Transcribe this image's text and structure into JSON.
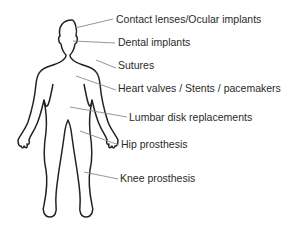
{
  "diagram": {
    "type": "labeled-body-outline",
    "colors": {
      "outline": "#222222",
      "leader": "#8a8a8a",
      "text": "#2a2a2a"
    },
    "labels": [
      {
        "text": "Contact lenses/Ocular implants",
        "x": 116,
        "y": 13,
        "points_to": "eye"
      },
      {
        "text": "Dental implants",
        "x": 118,
        "y": 36,
        "points_to": "mouth"
      },
      {
        "text": "Sutures",
        "x": 118,
        "y": 59,
        "points_to": "shoulder"
      },
      {
        "text": "Heart valves / Stents / pacemakers",
        "x": 118,
        "y": 82,
        "points_to": "chest"
      },
      {
        "text": "Lumbar disk replacements",
        "x": 129,
        "y": 111,
        "points_to": "lower back"
      },
      {
        "text": "Hip prosthesis",
        "x": 121,
        "y": 138,
        "points_to": "hip"
      },
      {
        "text": "Knee prosthesis",
        "x": 120,
        "y": 172,
        "points_to": "knee"
      }
    ]
  }
}
